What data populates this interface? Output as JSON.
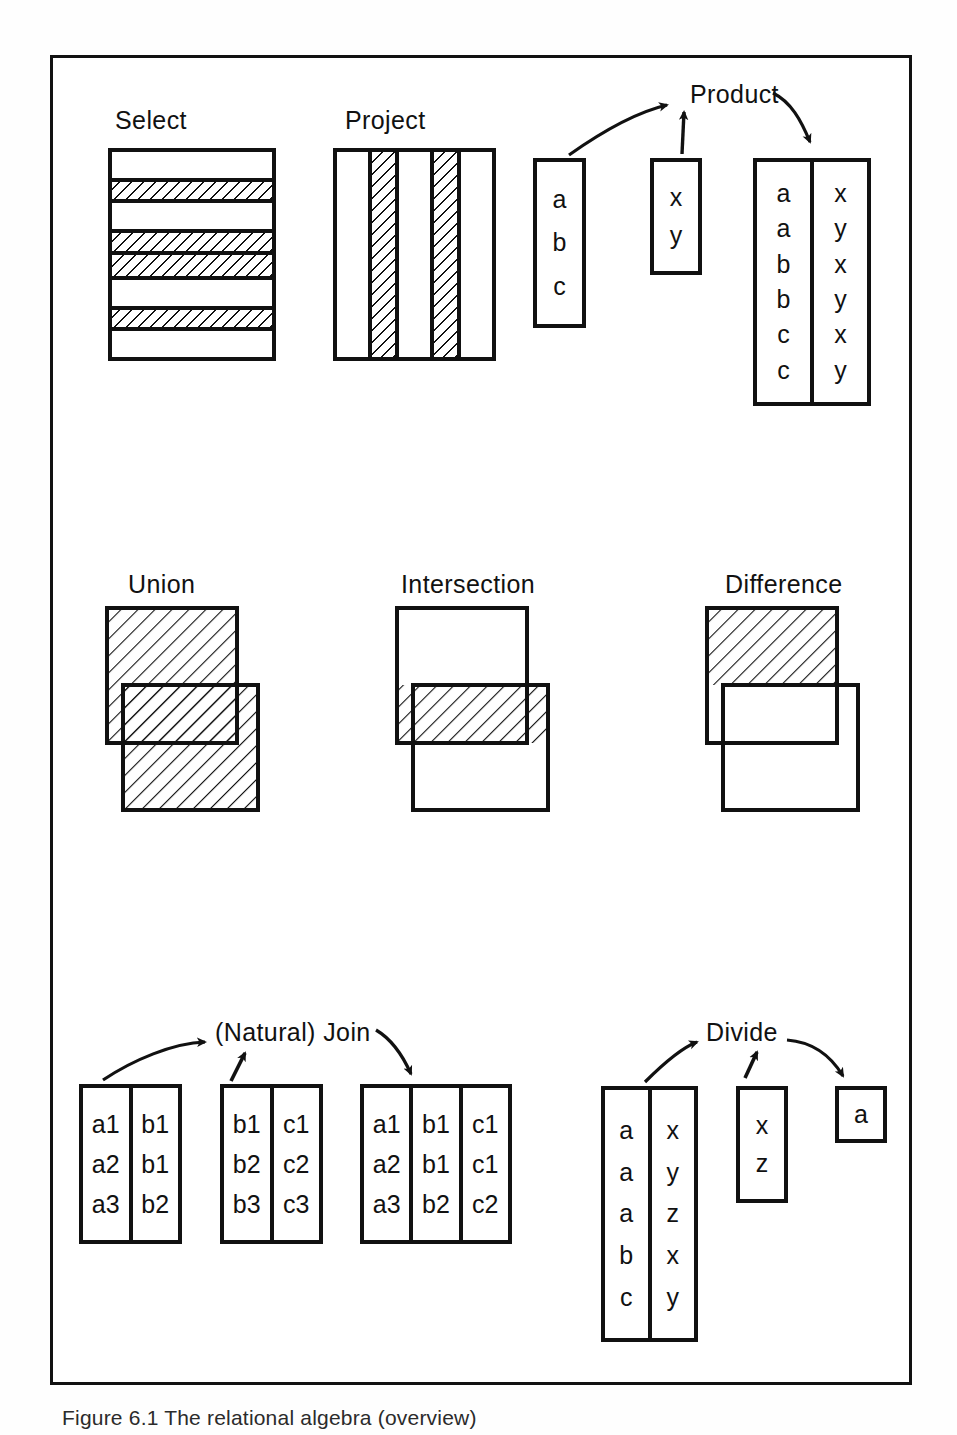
{
  "figure": {
    "caption": "Figure 6.1  The relational algebra (overview)"
  },
  "operations": {
    "select": {
      "title": "Select",
      "kind": "row-stripes",
      "rows": [
        "plain",
        "hatched",
        "plain",
        "hatched",
        "hatched",
        "plain",
        "hatched",
        "plain"
      ]
    },
    "project": {
      "title": "Project",
      "kind": "column-stripes",
      "columns": [
        "plain",
        "hatched",
        "plain",
        "hatched",
        "plain"
      ]
    },
    "product": {
      "title": "Product",
      "operand1": {
        "columns": [
          [
            "a",
            "b",
            "c"
          ]
        ]
      },
      "operand2": {
        "columns": [
          [
            "x",
            "y"
          ]
        ]
      },
      "result": {
        "columns": [
          [
            "a",
            "a",
            "b",
            "b",
            "c",
            "c"
          ],
          [
            "x",
            "y",
            "x",
            "y",
            "x",
            "y"
          ]
        ]
      }
    },
    "union": {
      "title": "Union",
      "kind": "two-rect",
      "shaded": "both"
    },
    "intersection": {
      "title": "Intersection",
      "kind": "two-rect",
      "shaded": "overlap"
    },
    "difference": {
      "title": "Difference",
      "kind": "two-rect",
      "shaded": "first-minus-overlap"
    },
    "join": {
      "title": "(Natural) Join",
      "operand1": {
        "columns": [
          [
            "a1",
            "a2",
            "a3"
          ],
          [
            "b1",
            "b1",
            "b2"
          ]
        ]
      },
      "operand2": {
        "columns": [
          [
            "b1",
            "b2",
            "b3"
          ],
          [
            "c1",
            "c2",
            "c3"
          ]
        ]
      },
      "result": {
        "columns": [
          [
            "a1",
            "a2",
            "a3"
          ],
          [
            "b1",
            "b1",
            "b2"
          ],
          [
            "c1",
            "c1",
            "c2"
          ]
        ]
      }
    },
    "divide": {
      "title": "Divide",
      "operand1": {
        "columns": [
          [
            "a",
            "a",
            "a",
            "b",
            "c"
          ],
          [
            "x",
            "y",
            "z",
            "x",
            "y"
          ]
        ]
      },
      "operand2": {
        "columns": [
          [
            "x",
            "z"
          ]
        ]
      },
      "result": {
        "columns": [
          [
            "a"
          ]
        ]
      }
    }
  },
  "colors": {
    "ink": "#111111",
    "paper": "#ffffff"
  }
}
